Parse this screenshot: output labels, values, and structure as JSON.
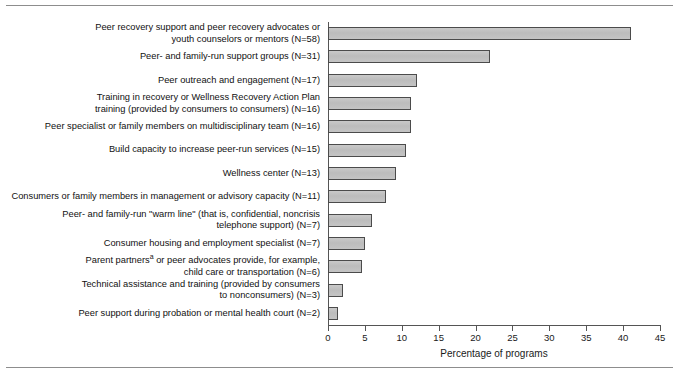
{
  "chart_data": {
    "type": "bar",
    "orientation": "horizontal",
    "title": "",
    "xlabel": "Percentage of programs",
    "ylabel": "",
    "xlim": [
      0,
      45
    ],
    "xticks": [
      0,
      5,
      10,
      15,
      20,
      25,
      30,
      35,
      40,
      45
    ],
    "grid": false,
    "legend": null,
    "categories": [
      "Peer recovery support and peer recovery advocates or youth counselors or mentors (N=58)",
      "Peer- and family-run support groups (N=31)",
      "Peer outreach and engagement (N=17)",
      "Training in recovery or Wellness Recovery Action Plan training (provided by consumers to consumers) (N=16)",
      "Peer specialist or family members on multidisciplinary team (N=16)",
      "Build capacity to increase peer-run services (N=15)",
      "Wellness center (N=13)",
      "Consumers or family members in management or advisory capacity (N=11)",
      "Peer- and family-run \"warm line\" (that is, confidential, noncrisis telephone support) (N=7)",
      "Consumer housing and employment specialist (N=7)",
      "Parent partnersᵃ or peer advocates provide, for example, child care or transportation (N=6)",
      "Technical assistance and training (provided by consumers to nonconsumers) (N=3)",
      "Peer support during probation or mental health court (N=2)"
    ],
    "category_lines": [
      [
        "Peer recovery support and peer recovery advocates or",
        "youth counselors or mentors (N=58)"
      ],
      [
        "Peer- and family-run support groups (N=31)"
      ],
      [
        "Peer outreach and engagement (N=17)"
      ],
      [
        "Training in recovery or Wellness Recovery Action Plan",
        "training (provided by consumers to consumers) (N=16)"
      ],
      [
        "Peer specialist or family members on multidisciplinary team (N=16)"
      ],
      [
        "Build capacity to increase peer-run services (N=15)"
      ],
      [
        "Wellness center (N=13)"
      ],
      [
        "Consumers or family members in management or advisory capacity (N=11)"
      ],
      [
        "Peer- and family-run \"warm line\" (that is, confidential, noncrisis",
        "telephone support) (N=7)"
      ],
      [
        "Consumer housing and employment specialist (N=7)"
      ],
      [
        "Parent partners<sup>a</sup> or peer advocates provide, for example,",
        "child care or transportation (N=6)"
      ],
      [
        "Technical assistance and training (provided by consumers",
        "to nonconsumers) (N=3)"
      ],
      [
        "Peer support during probation or mental health court (N=2)"
      ]
    ],
    "values": [
      41.1,
      22.0,
      12.1,
      11.3,
      11.3,
      10.6,
      9.2,
      7.8,
      5.9,
      5.0,
      4.6,
      2.1,
      1.4
    ],
    "counts": [
      58,
      31,
      17,
      16,
      16,
      15,
      13,
      11,
      7,
      7,
      6,
      3,
      2
    ],
    "bar_fill_color": "#c4c4c4",
    "bar_edge_color": "#4b4b4b",
    "axis_color": "#555555"
  }
}
